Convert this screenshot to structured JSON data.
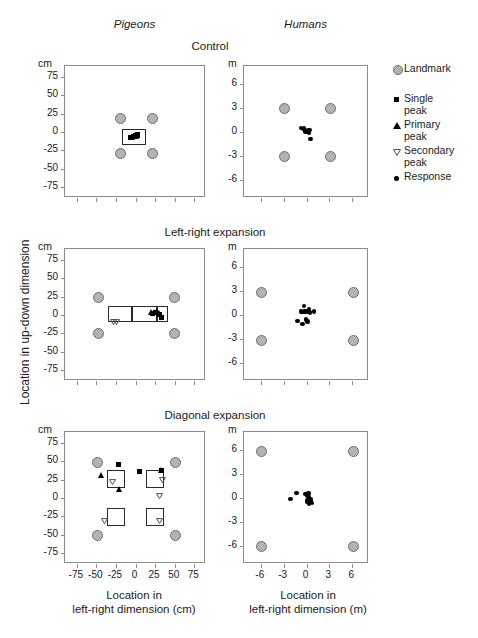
{
  "figure": {
    "column_titles": [
      "Pigeons",
      "Humans"
    ],
    "row_titles": [
      "Control",
      "Left-right expansion",
      "Diagonal expansion"
    ],
    "y_axis_title": "Location in up-down dimension",
    "x_axis_title_left": "Location in\nleft-right dimension (cm)",
    "x_axis_title_left_line1": "Location in",
    "x_axis_title_left_line2": "left-right dimension (cm)",
    "x_axis_title_right_line1": "Location in",
    "x_axis_title_right_line2": "left-right dimension (m)",
    "unit_left": "cm",
    "unit_right": "m"
  },
  "legend": {
    "items": [
      {
        "symbol": "landmark-circle-icon",
        "label_line1": "Landmark",
        "label_line2": ""
      },
      {
        "symbol": "single-peak-square-icon",
        "label_line1": "Single",
        "label_line2": "peak"
      },
      {
        "symbol": "primary-peak-triangle-icon",
        "label_line1": "Primary",
        "label_line2": "peak"
      },
      {
        "symbol": "secondary-peak-triangle-icon",
        "label_line1": "Secondary",
        "label_line2": "peak"
      },
      {
        "symbol": "response-dot-icon",
        "label_line1": "Response",
        "label_line2": ""
      }
    ]
  },
  "colors": {
    "landmark_fill": "#b3b3b3",
    "landmark_stroke": "#6e6e6e",
    "marker_black": "#000000",
    "secondary_gray": "#555555",
    "frame": "#8a8a8a",
    "background": "#ffffff"
  },
  "chart_data": [
    {
      "id": "pigeons-control",
      "type": "scatter",
      "title": "Control",
      "group": "Pigeons",
      "xlabel": "Location in left-right dimension (cm)",
      "ylabel": "Location in up-down dimension (cm)",
      "unit": "cm",
      "xlim": [
        -90,
        90
      ],
      "ylim": [
        -90,
        90
      ],
      "xticks": [
        -75,
        -50,
        -25,
        0,
        25,
        50,
        75
      ],
      "xticklabels": [
        "",
        "",
        "",
        "",
        "",
        "",
        ""
      ],
      "yticks": [
        75,
        50,
        25,
        0,
        -25,
        -50,
        -75
      ],
      "yticklabels": [
        "75",
        "50",
        "25",
        "0",
        "-25",
        "-50",
        "-75"
      ],
      "grid": false,
      "series": [
        {
          "name": "Landmark",
          "marker": "circle-gray",
          "points": [
            [
              -20,
              20
            ],
            [
              20,
              20
            ],
            [
              -20,
              -28
            ],
            [
              20,
              -28
            ]
          ]
        },
        {
          "name": "Single peak",
          "marker": "square-black",
          "points": [
            [
              -5,
              -7
            ],
            [
              -2,
              -6
            ],
            [
              0,
              -5
            ],
            [
              2,
              -5
            ],
            [
              -7,
              -8
            ],
            [
              3,
              -4
            ]
          ]
        },
        {
          "name": "Primary peak",
          "marker": "triangle-up-black",
          "points": [
            [
              -4,
              -7
            ],
            [
              1,
              -6
            ]
          ]
        },
        {
          "name": "Secondary peak",
          "marker": "triangle-down-open",
          "points": []
        }
      ],
      "boxes": [
        {
          "x0": -17,
          "y0": -18,
          "x1": 14,
          "y1": 4
        }
      ]
    },
    {
      "id": "humans-control",
      "type": "scatter",
      "title": "Control",
      "group": "Humans",
      "xlabel": "Location in left-right dimension (m)",
      "ylabel": "Location in up-down dimension (m)",
      "unit": "m",
      "xlim": [
        -8.2,
        8.2
      ],
      "ylim": [
        -8.2,
        8.2
      ],
      "xticks": [
        -6,
        -3,
        0,
        3,
        6
      ],
      "xticklabels": [
        "",
        "",
        "",
        "",
        ""
      ],
      "yticks": [
        6,
        3,
        0,
        -3,
        -6
      ],
      "yticklabels": [
        "6",
        "3",
        "0",
        "-3",
        "-6"
      ],
      "grid": false,
      "series": [
        {
          "name": "Landmark",
          "marker": "circle-gray",
          "points": [
            [
              -3.0,
              3.1
            ],
            [
              3.0,
              3.1
            ],
            [
              -3.0,
              -2.9
            ],
            [
              3.0,
              -2.9
            ]
          ]
        },
        {
          "name": "Response",
          "marker": "dot-black",
          "points": [
            [
              -0.7,
              0.5
            ],
            [
              -0.45,
              0.35
            ],
            [
              -0.3,
              0.5
            ],
            [
              -0.2,
              0.2
            ],
            [
              -0.1,
              0.05
            ],
            [
              0.05,
              0.15
            ],
            [
              0.1,
              0.0
            ],
            [
              0.25,
              0.2
            ],
            [
              0.3,
              0.05
            ],
            [
              0.45,
              0.25
            ],
            [
              0.35,
              -0.15
            ],
            [
              0.55,
              -0.9
            ]
          ]
        }
      ],
      "boxes": []
    },
    {
      "id": "pigeons-left-right-expansion",
      "type": "scatter",
      "title": "Left-right expansion",
      "group": "Pigeons",
      "xlabel": "Location in left-right dimension (cm)",
      "ylabel": "Location in up-down dimension (cm)",
      "unit": "cm",
      "xlim": [
        -90,
        90
      ],
      "ylim": [
        -90,
        90
      ],
      "xticks": [
        -75,
        -50,
        -25,
        0,
        25,
        50,
        75
      ],
      "xticklabels": [
        "",
        "",
        "",
        "",
        "",
        "",
        ""
      ],
      "yticks": [
        75,
        50,
        25,
        0,
        -25,
        -50,
        -75
      ],
      "yticklabels": [
        "75",
        "50",
        "25",
        "0",
        "-25",
        "-50",
        "-75"
      ],
      "grid": false,
      "series": [
        {
          "name": "Landmark",
          "marker": "circle-gray",
          "points": [
            [
              -48,
              25
            ],
            [
              48,
              25
            ],
            [
              -48,
              -24
            ],
            [
              48,
              -24
            ]
          ]
        },
        {
          "name": "Single peak",
          "marker": "square-black",
          "points": [
            [
              22,
              2
            ],
            [
              26,
              3
            ],
            [
              30,
              1
            ],
            [
              33,
              -4
            ]
          ]
        },
        {
          "name": "Primary peak",
          "marker": "triangle-up-black",
          "points": [
            [
              20,
              4
            ],
            [
              24,
              4
            ],
            [
              28,
              5
            ],
            [
              31,
              3
            ]
          ]
        },
        {
          "name": "Secondary peak",
          "marker": "triangle-down-open",
          "points": [
            [
              -28,
              2
            ],
            [
              -24,
              2
            ]
          ]
        }
      ],
      "boxes": [
        {
          "x0": -35,
          "y0": -10,
          "x1": -4,
          "y1": 12
        },
        {
          "x0": -4,
          "y0": -10,
          "x1": 27,
          "y1": 12
        },
        {
          "x0": 27,
          "y0": -10,
          "x1": 42,
          "y1": 12
        }
      ]
    },
    {
      "id": "humans-left-right-expansion",
      "type": "scatter",
      "title": "Left-right expansion",
      "group": "Humans",
      "xlabel": "Location in left-right dimension (m)",
      "ylabel": "Location in up-down dimension (m)",
      "unit": "m",
      "xlim": [
        -8.2,
        8.2
      ],
      "ylim": [
        -8.2,
        8.2
      ],
      "xticks": [
        -6,
        -3,
        0,
        3,
        6
      ],
      "xticklabels": [
        "",
        "",
        "",
        "",
        ""
      ],
      "yticks": [
        6,
        3,
        0,
        -3,
        -6
      ],
      "yticklabels": [
        "6",
        "3",
        "0",
        "-3",
        "-6"
      ],
      "grid": false,
      "series": [
        {
          "name": "Landmark",
          "marker": "circle-gray",
          "points": [
            [
              -6.0,
              2.95
            ],
            [
              6.0,
              2.95
            ],
            [
              -6.0,
              -3.05
            ],
            [
              6.0,
              -3.05
            ]
          ]
        },
        {
          "name": "Response",
          "marker": "dot-black",
          "points": [
            [
              -0.75,
              0.45
            ],
            [
              -0.55,
              0.35
            ],
            [
              -0.3,
              1.1
            ],
            [
              -0.25,
              0.45
            ],
            [
              -0.05,
              0.5
            ],
            [
              0.1,
              0.35
            ],
            [
              0.3,
              0.75
            ],
            [
              0.45,
              0.3
            ],
            [
              1.0,
              0.45
            ],
            [
              -1.2,
              -0.75
            ],
            [
              -0.55,
              -1.1
            ],
            [
              -0.05,
              -0.55
            ],
            [
              0.15,
              -0.8
            ]
          ]
        }
      ],
      "boxes": []
    },
    {
      "id": "pigeons-diagonal-expansion",
      "type": "scatter",
      "title": "Diagonal expansion",
      "group": "Pigeons",
      "xlabel": "Location in left-right dimension (cm)",
      "ylabel": "Location in up-down dimension (cm)",
      "unit": "cm",
      "xlim": [
        -90,
        90
      ],
      "ylim": [
        -90,
        90
      ],
      "xticks": [
        -75,
        -50,
        -25,
        0,
        25,
        50,
        75
      ],
      "xticklabels": [
        "-75",
        "-50",
        "-25",
        "0",
        "25",
        "50",
        "75"
      ],
      "yticks": [
        75,
        50,
        25,
        0,
        -25,
        -50,
        -75
      ],
      "yticklabels": [
        "75",
        "50",
        "25",
        "0",
        "-25",
        "-50",
        "-75"
      ],
      "grid": false,
      "series": [
        {
          "name": "Landmark",
          "marker": "circle-gray",
          "points": [
            [
              -50,
              50
            ],
            [
              50,
              50
            ],
            [
              -50,
              -50
            ],
            [
              50,
              -50
            ]
          ]
        },
        {
          "name": "Single peak",
          "marker": "square-black",
          "points": [
            [
              -22,
              46
            ],
            [
              5,
              36
            ],
            [
              33,
              37
            ]
          ]
        },
        {
          "name": "Primary peak",
          "marker": "triangle-up-black",
          "points": [
            [
              -43,
              32
            ],
            [
              -21,
              13
            ],
            [
              33,
              38
            ]
          ]
        },
        {
          "name": "Secondary peak",
          "marker": "triangle-down-open",
          "points": [
            [
              -29,
              33
            ],
            [
              34,
              35
            ],
            [
              30,
              14
            ],
            [
              -39,
              -20
            ],
            [
              30,
              -21
            ]
          ]
        }
      ],
      "boxes": [
        {
          "x0": -37,
          "y0": 14,
          "x1": -13,
          "y1": 38
        },
        {
          "x0": 13,
          "y0": 14,
          "x1": 37,
          "y1": 38
        },
        {
          "x0": -37,
          "y0": -38,
          "x1": -13,
          "y1": -14
        },
        {
          "x0": 13,
          "y0": -38,
          "x1": 37,
          "y1": -14
        }
      ]
    },
    {
      "id": "humans-diagonal-expansion",
      "type": "scatter",
      "title": "Diagonal expansion",
      "group": "Humans",
      "xlabel": "Location in left-right dimension (m)",
      "ylabel": "Location in up-down dimension (m)",
      "unit": "m",
      "xlim": [
        -8.2,
        8.2
      ],
      "ylim": [
        -8.2,
        8.2
      ],
      "xticks": [
        -6,
        -3,
        0,
        3,
        6
      ],
      "xticklabels": [
        "-6",
        "-3",
        "0",
        "3",
        "6"
      ],
      "yticks": [
        6,
        3,
        0,
        -3,
        -6
      ],
      "yticklabels": [
        "6",
        "3",
        "0",
        "-3",
        "-6"
      ],
      "grid": false,
      "series": [
        {
          "name": "Landmark",
          "marker": "circle-gray",
          "points": [
            [
              -6.0,
              5.85
            ],
            [
              6.0,
              5.85
            ],
            [
              -6.0,
              -5.9
            ],
            [
              6.0,
              -5.9
            ]
          ]
        },
        {
          "name": "Response",
          "marker": "dot-black",
          "points": [
            [
              -2.1,
              -0.15
            ],
            [
              -1.3,
              0.65
            ],
            [
              -0.1,
              0.5
            ],
            [
              0.1,
              0.3
            ],
            [
              0.25,
              0.55
            ],
            [
              0.3,
              0.1
            ],
            [
              0.15,
              -0.3
            ],
            [
              0.35,
              -0.35
            ],
            [
              0.05,
              -0.5
            ],
            [
              0.3,
              -0.7
            ],
            [
              0.6,
              -0.45
            ],
            [
              0.55,
              -0.1
            ],
            [
              0.75,
              -0.6
            ]
          ]
        }
      ],
      "boxes": []
    }
  ]
}
